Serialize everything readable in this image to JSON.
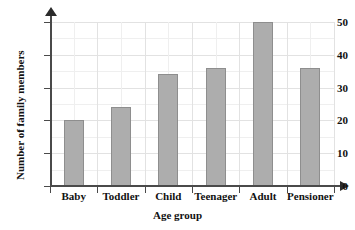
{
  "chart_data": {
    "type": "bar",
    "title": "",
    "categories": [
      "Baby",
      "Toddler",
      "Child",
      "Teenager",
      "Adult",
      "Pensioner"
    ],
    "values": [
      20,
      24,
      34,
      36,
      50,
      36
    ],
    "xlabel": "Age group",
    "ylabel": "Number of family members",
    "ylim": [
      0,
      50
    ],
    "yticks": [
      0,
      10,
      20,
      30,
      40,
      50
    ],
    "ytick_labels": [
      "0",
      "10",
      "20",
      "30",
      "40",
      "50"
    ],
    "grid": true,
    "legend": false,
    "bar_color": "#adadad",
    "bar_edge_color": "#8e8e8e",
    "grid_color": "#e2e2e2",
    "axis_color": "#4a4a4a",
    "background_color": "#ffffff"
  }
}
